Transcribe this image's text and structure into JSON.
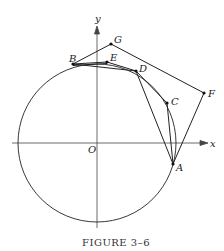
{
  "figure": {
    "caption": "Figure 3–6",
    "caption_display": "FIGURE 3–6"
  },
  "axes": {
    "x_label": "x",
    "y_label": "y",
    "origin_label": "O"
  },
  "circle": {
    "center": "O"
  },
  "points": {
    "A": "A",
    "B": "B",
    "C": "C",
    "D": "D",
    "E": "E",
    "F": "F",
    "G": "G"
  },
  "colors": {
    "ink": "#222222",
    "background": "#ffffff"
  }
}
